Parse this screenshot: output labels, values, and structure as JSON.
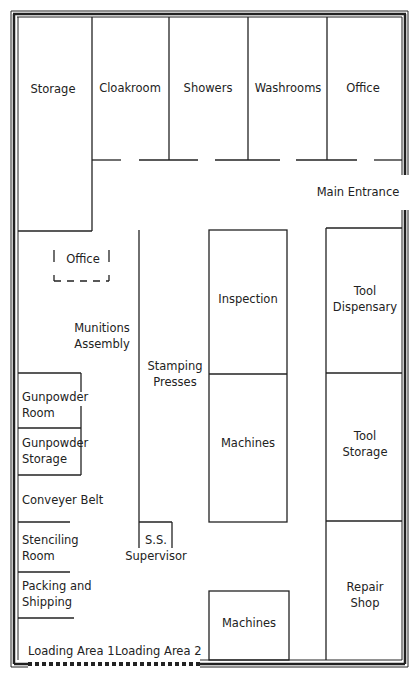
{
  "rooms": {
    "storage": "Storage",
    "cloakroom": "Cloakroom",
    "showers": "Showers",
    "washrooms": "Washrooms",
    "office_top": "Office",
    "main_entrance": "Main Entrance",
    "office_dashed": "Office",
    "munitions_assembly_1": "Munitions",
    "munitions_assembly_2": "Assembly",
    "stamping_presses_1": "Stamping",
    "stamping_presses_2": "Presses",
    "inspection": "Inspection",
    "machines_mid": "Machines",
    "tool_dispensary_1": "Tool",
    "tool_dispensary_2": "Dispensary",
    "tool_storage_1": "Tool",
    "tool_storage_2": "Storage",
    "gunpowder_room_1": "Gunpowder",
    "gunpowder_room_2": "Room",
    "gunpowder_storage_1": "Gunpowder",
    "gunpowder_storage_2": "Storage",
    "conveyer_belt": "Conveyer Belt",
    "stenciling_room_1": "Stenciling",
    "stenciling_room_2": "Room",
    "ss_supervisor_1": "S.S.",
    "ss_supervisor_2": "Supervisor",
    "packing_shipping_1": "Packing and",
    "packing_shipping_2": "Shipping",
    "repair_shop_1": "Repair",
    "repair_shop_2": "Shop",
    "machines_bottom": "Machines",
    "loading_area_1": "Loading Area 1",
    "loading_area_2": "Loading Area 2"
  },
  "colors": {
    "line": "#222222",
    "background": "#ffffff"
  }
}
